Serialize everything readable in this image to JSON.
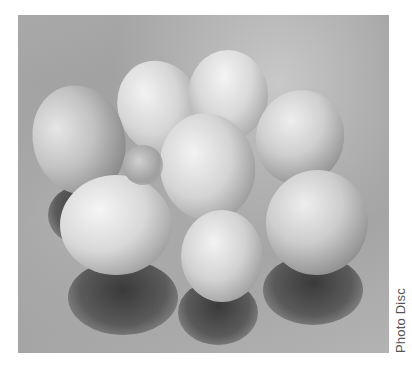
{
  "image": {
    "subject": "nine eggs on a reflective surface, black-and-white photograph",
    "egg_count": 9
  },
  "caption": {
    "credit": "Photo Disc"
  },
  "colors": {
    "background": "#ffffff",
    "caption_text": "#555555"
  }
}
